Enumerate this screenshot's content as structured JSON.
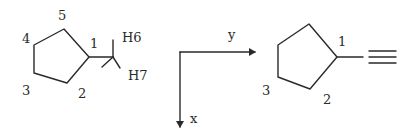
{
  "left_molecule": {
    "name": "cyclopentyl-methyl fragment",
    "ring_labels": [
      "1",
      "2",
      "3",
      "4",
      "5"
    ],
    "hydrogen_labels": [
      "H6",
      "H7"
    ]
  },
  "axes": {
    "horizontal_label": "y",
    "vertical_label": "x"
  },
  "right_molecule": {
    "name": "cyclopentyl with triple-bond substituent",
    "ring_labels": [
      "1",
      "2",
      "3"
    ]
  }
}
